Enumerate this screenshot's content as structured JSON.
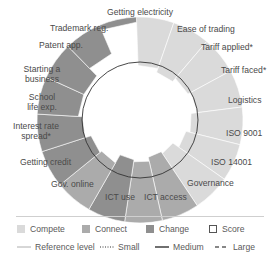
{
  "chart_data": {
    "type": "radar",
    "title": "",
    "scale": [
      0,
      100
    ],
    "reference_level": 50,
    "categories": [
      "Getting electricity",
      "Ease of trading",
      "Tariff applied*",
      "Tariff faced*",
      "Logistics",
      "ISO 9001",
      "ISO 14001",
      "Governance",
      "ICT access",
      "ICT use",
      "Gov. online",
      "Getting credit",
      "Interest rate spread*",
      "School life exp.",
      "Starting a business",
      "Patent app.",
      "Trademark reg."
    ],
    "groups": [
      "Compete",
      "Compete",
      "Compete",
      "Compete",
      "Compete",
      "Compete",
      "Compete",
      "Connect",
      "Connect",
      "Change",
      "Connect",
      "Change",
      "Change",
      "Change",
      "Change",
      "Change",
      "Change"
    ],
    "series": [
      {
        "name": "Score",
        "values": [
          53,
          49,
          53,
          56,
          50,
          46,
          39,
          37,
          41,
          39,
          48,
          50,
          56,
          60,
          60,
          70,
          95
        ]
      }
    ],
    "legend": {
      "fills": [
        {
          "name": "Compete",
          "color": "#dadada"
        },
        {
          "name": "Connect",
          "color": "#ababab"
        },
        {
          "name": "Change",
          "color": "#8f8f8f"
        },
        {
          "name": "Score",
          "color": "#ffffff"
        }
      ],
      "lines": [
        {
          "name": "Reference level",
          "style": "thin"
        },
        {
          "name": "Small",
          "style": "dotted"
        },
        {
          "name": "Medium",
          "style": "solid"
        },
        {
          "name": "Large",
          "style": "dashed"
        }
      ]
    },
    "grid": false
  },
  "labels": [
    {
      "text": "Getting electricity",
      "x": 139,
      "y": 11,
      "align": "c"
    },
    {
      "text": "Ease of trading",
      "x": 204,
      "y": 27,
      "align": "c"
    },
    {
      "text": "Tariff applied*",
      "x": 221,
      "y": 43,
      "align": "l",
      "left": 202
    },
    {
      "text": "Tariff faced*",
      "x": 222,
      "y": 66,
      "align": "l",
      "left": 221
    },
    {
      "text": "Logistics",
      "x": 230,
      "y": 96,
      "align": "l",
      "left": 228
    },
    {
      "text": "ISO 9001",
      "x": 228,
      "y": 128,
      "align": "l",
      "left": 226
    },
    {
      "text": "ISO 14001",
      "x": 210,
      "y": 157,
      "align": "l",
      "left": 211
    },
    {
      "text": "Governance",
      "x": 185,
      "y": 180,
      "align": "l",
      "left": 187
    },
    {
      "text": "ICT access",
      "x": 145,
      "y": 192,
      "align": "l",
      "left": 145
    },
    {
      "text": "ICT use",
      "x": 107,
      "y": 192,
      "align": "l",
      "left": 106
    },
    {
      "text": "Gov. online",
      "x": 52,
      "y": 180,
      "align": "l",
      "left": 52
    },
    {
      "text": "Getting credit",
      "x": 20,
      "y": 157,
      "align": "l",
      "left": 20
    }
  ],
  "legend_text": {
    "compete": "Compete",
    "connect": "Connect",
    "change": "Change",
    "score": "Score",
    "reference": "Reference level",
    "small": "Small",
    "medium": "Medium",
    "large": "Large"
  },
  "axis_text": {
    "getting_electricity": "Getting electricity",
    "ease_of_trading": "Ease of trading",
    "tariff_applied": "Tariff applied*",
    "tariff_faced": "Tariff faced*",
    "logistics": "Logistics",
    "iso9001": "ISO 9001",
    "iso14001": "ISO 14001",
    "governance": "Governance",
    "ict_access": "ICT access",
    "ict_use": "ICT use",
    "gov_online": "Gov. online",
    "getting_credit": "Getting credit",
    "interest_l1": "Interest rate",
    "interest_l2": "spread*",
    "school_l1": "School",
    "school_l2": "life exp.",
    "starting_l1": "Starting a",
    "starting_l2": "business",
    "patent": "Patent app.",
    "trademark": "Trademark reg."
  }
}
